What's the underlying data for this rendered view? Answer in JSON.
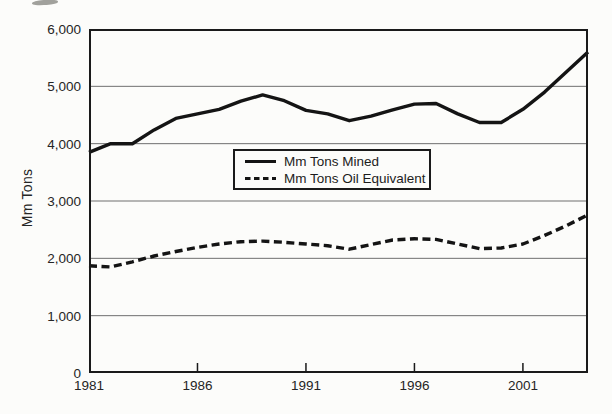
{
  "page": {
    "background": "#fcfcfa",
    "ink_color": "#141414"
  },
  "chart_data": {
    "type": "line",
    "title": "",
    "xlabel": "",
    "ylabel": "Mm Tons",
    "xlim": [
      1981,
      2004
    ],
    "ylim": [
      0,
      6000
    ],
    "grid": "horizontal",
    "legend_position": "upper-center-inside",
    "x": [
      1981,
      1982,
      1983,
      1984,
      1985,
      1986,
      1987,
      1988,
      1989,
      1990,
      1991,
      1992,
      1993,
      1994,
      1995,
      1996,
      1997,
      1998,
      1999,
      2000,
      2001,
      2002,
      2003,
      2004
    ],
    "x_ticks": [
      {
        "label": "1981",
        "year": 1981
      },
      {
        "label": "1986",
        "year": 1986
      },
      {
        "label": "1991",
        "year": 1991
      },
      {
        "label": "1996",
        "year": 1996
      },
      {
        "label": "2001",
        "year": 2001
      }
    ],
    "y_ticks": [
      {
        "label": "0",
        "value": 0
      },
      {
        "label": "1,000",
        "value": 1000
      },
      {
        "label": "2,000",
        "value": 2000
      },
      {
        "label": "3,000",
        "value": 3000
      },
      {
        "label": "4,000",
        "value": 4000
      },
      {
        "label": "5,000",
        "value": 5000
      },
      {
        "label": "6,000",
        "value": 6000
      }
    ],
    "series": [
      {
        "name": "Mm Tons Mined",
        "style": "solid",
        "color": "#141414",
        "values": [
          3850,
          4000,
          4000,
          4240,
          4440,
          4520,
          4600,
          4740,
          4850,
          4750,
          4580,
          4520,
          4400,
          4480,
          4590,
          4690,
          4700,
          4520,
          4370,
          4370,
          4600,
          4900,
          5250,
          5600
        ]
      },
      {
        "name": "Mm Tons Oil Equivalent",
        "style": "dashed",
        "color": "#141414",
        "values": [
          1870,
          1850,
          1940,
          2040,
          2120,
          2190,
          2250,
          2290,
          2300,
          2280,
          2250,
          2220,
          2160,
          2240,
          2320,
          2340,
          2330,
          2250,
          2170,
          2180,
          2250,
          2400,
          2570,
          2760
        ]
      }
    ]
  }
}
